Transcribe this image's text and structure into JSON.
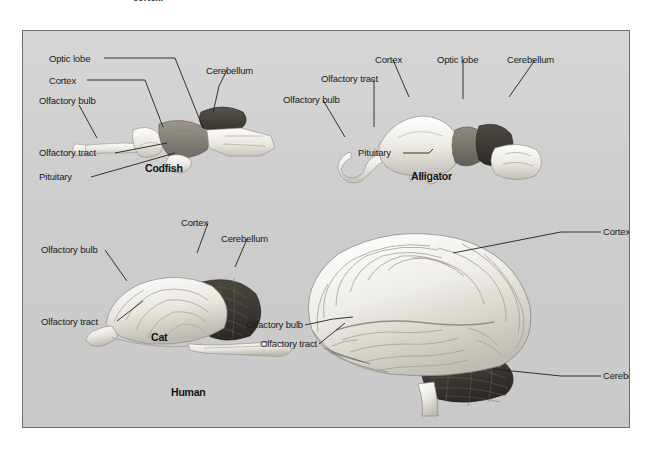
{
  "page": {
    "caption_fragment": "cortex.",
    "background_color": "#ffffff",
    "panel_background_color": "#cfcfcf",
    "panel_border_color": "#6e6e6e",
    "label_color": "#1a1a1a"
  },
  "figure": {
    "specimens": [
      {
        "id": "codfish",
        "name": "Codfish",
        "labels": [
          {
            "text": "Optic lobe"
          },
          {
            "text": "Cortex"
          },
          {
            "text": "Olfactory bulb"
          },
          {
            "text": "Cerebellum"
          },
          {
            "text": "Olfactory tract"
          },
          {
            "text": "Pituitary"
          }
        ]
      },
      {
        "id": "alligator",
        "name": "Alligator",
        "labels": [
          {
            "text": "Cortex"
          },
          {
            "text": "Optic lobe"
          },
          {
            "text": "Cerebellum"
          },
          {
            "text": "Olfactory tract"
          },
          {
            "text": "Olfactory bulb"
          },
          {
            "text": "Pituitary"
          }
        ]
      },
      {
        "id": "cat",
        "name": "Cat",
        "labels": [
          {
            "text": "Cortex"
          },
          {
            "text": "Cerebellum"
          },
          {
            "text": "Olfactory bulb"
          },
          {
            "text": "Olfactory tract"
          }
        ]
      },
      {
        "id": "human",
        "name": "Human",
        "labels": [
          {
            "text": "Cortex"
          },
          {
            "text": "Cerebellum"
          },
          {
            "text": "Olfactory bulb"
          },
          {
            "text": "Olfactory tract"
          }
        ]
      }
    ]
  }
}
